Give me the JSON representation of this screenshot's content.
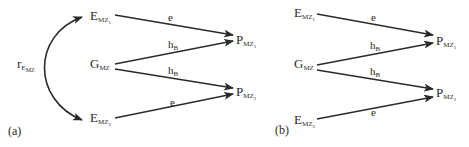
{
  "figure": {
    "panels": [
      {
        "label": "(a)",
        "correlation_label": {
          "main": "r",
          "sub": "E",
          "subsub": "MZ"
        },
        "nodes": {
          "E1": {
            "main": "E",
            "sub": "MZ",
            "subsub": "1"
          },
          "G": {
            "main": "G",
            "sub": "MZ"
          },
          "E2": {
            "main": "E",
            "sub": "MZ",
            "subsub": "2"
          },
          "P1": {
            "main": "P",
            "sub": "MZ",
            "subsub": "1"
          },
          "P2": {
            "main": "P",
            "sub": "MZ",
            "subsub": "2"
          }
        },
        "edges": [
          {
            "from": "E1",
            "to": "P1",
            "label": "e"
          },
          {
            "from": "G",
            "to": "P1",
            "label": "h",
            "label_sub": "B"
          },
          {
            "from": "G",
            "to": "P2",
            "label": "h",
            "label_sub": "B"
          },
          {
            "from": "E2",
            "to": "P2",
            "label": "e"
          }
        ]
      },
      {
        "label": "(b)",
        "nodes": {
          "E1": {
            "main": "E",
            "sub": "MZ",
            "subsub": "1"
          },
          "G": {
            "main": "G",
            "sub": "MZ"
          },
          "E2": {
            "main": "E",
            "sub": "MZ",
            "subsub": "2"
          },
          "P1": {
            "main": "P",
            "sub": "MZ",
            "subsub": "1"
          },
          "P2": {
            "main": "P",
            "sub": "MZ",
            "subsub": "2"
          }
        },
        "edges": [
          {
            "from": "E1",
            "to": "P1",
            "label": "e"
          },
          {
            "from": "G",
            "to": "P1",
            "label": "h",
            "label_sub": "B"
          },
          {
            "from": "G",
            "to": "P2",
            "label": "h",
            "label_sub": "B"
          },
          {
            "from": "E2",
            "to": "P2",
            "label": "e"
          }
        ]
      }
    ],
    "colors": {
      "ink": "#2a2a2a",
      "background": "#ffffff"
    }
  }
}
